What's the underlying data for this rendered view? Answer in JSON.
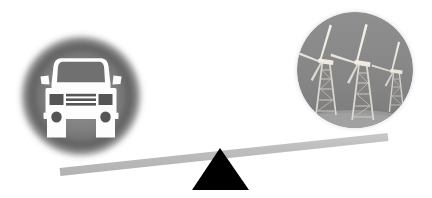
{
  "canvas": {
    "width": 432,
    "height": 198,
    "background": "#ffffff",
    "title": "Seesaw balance comparing a car against wind turbines"
  },
  "colors": {
    "background": "#ffffff",
    "circle_gray_core": "#8a8a8a",
    "circle_gray_mid": "#7a7a7a",
    "circle_gray_edge": "#4a4a4a",
    "beam_gray": "#b9b9b9",
    "beam_gray_light": "#c9c9c9",
    "fulcrum_black": "#000000",
    "car_white": "#fdfdfd",
    "car_dark": "#555555",
    "windshield_gray": "#6f6f6f",
    "turbine_light": "#e2e2e2",
    "turbine_mid": "#b0b0b0",
    "turbine_dark": "#5e5e5e",
    "ground_gray": "#9a9a9a"
  },
  "left_side": {
    "name": "car-medallion",
    "label": "car",
    "icon": "car-front-icon",
    "circle": {
      "cx": 81,
      "cy": 96,
      "r": 62
    },
    "position": "down",
    "car": {
      "body_color": "#fdfdfd",
      "windshield_color": "#6f6f6f",
      "detail_color": "#555555",
      "grille_bar_count": 3,
      "headlight_count": 2,
      "wheel_count": 2,
      "mirror_count": 2
    }
  },
  "right_side": {
    "name": "wind-turbines-medallion",
    "label": "wind turbines",
    "icon": "wind-turbine-icon",
    "circle": {
      "cx": 355,
      "cy": 70,
      "r": 58
    },
    "position": "up",
    "turbines": [
      {
        "index": 1,
        "x": 326,
        "scale": 1.0,
        "blades": 3,
        "tower": "lattice"
      },
      {
        "index": 2,
        "x": 363,
        "scale": 1.08,
        "blades": 3,
        "tower": "lattice"
      },
      {
        "index": 3,
        "x": 396,
        "scale": 0.72,
        "blades": 3,
        "tower": "lattice"
      }
    ]
  },
  "seesaw": {
    "name": "seesaw-beam",
    "beam": {
      "x1": 60,
      "y1": 172,
      "x2": 388,
      "y2": 137,
      "thickness": 8,
      "color": "#b9b9b9",
      "tilt_direction": "left-down"
    },
    "fulcrum": {
      "name": "fulcrum-triangle",
      "apex_x": 220,
      "apex_y": 148,
      "base_left_x": 192,
      "base_right_x": 249,
      "base_y": 190,
      "color": "#000000"
    }
  }
}
